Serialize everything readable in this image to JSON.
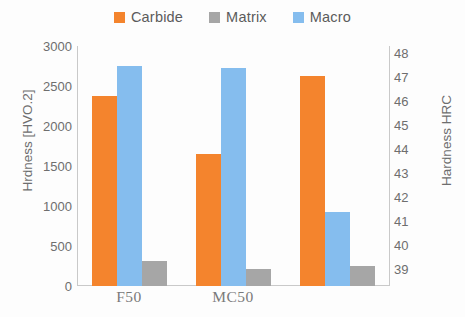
{
  "legend": {
    "items": [
      {
        "label": "Carbide",
        "color": "#F4842D",
        "icon": "square-swatch-icon"
      },
      {
        "label": "Matrix",
        "color": "#A6A6A6",
        "icon": "square-swatch-icon"
      },
      {
        "label": "Macro",
        "color": "#85BDEE",
        "icon": "square-swatch-icon"
      }
    ]
  },
  "axes": {
    "left": {
      "title": "Hrdness [HVO.2]",
      "ticks": [
        "3000",
        "2500",
        "2000",
        "1500",
        "1000",
        "500",
        "0"
      ],
      "min": 0,
      "max": 3000
    },
    "right": {
      "title": "Hardness HRC",
      "ticks": [
        "48",
        "47",
        "46",
        "45",
        "44",
        "43",
        "42",
        "41",
        "40",
        "39"
      ],
      "min": 39,
      "max": 48
    }
  },
  "chart_data": {
    "type": "bar",
    "title": "",
    "xlabel": "",
    "ylabel": "Hrdness [HVO.2]",
    "y2label": "Hardness HRC",
    "ylim": [
      0,
      3000
    ],
    "y2lim": [
      39,
      48
    ],
    "grid": false,
    "legend_position": "top-center",
    "categories": [
      "F50",
      "MC50",
      ""
    ],
    "series": [
      {
        "name": "Carbide",
        "color": "#F4842D",
        "axis": "left",
        "values": [
          2370,
          1650,
          2620
        ]
      },
      {
        "name": "Matrix",
        "color": "#A6A6A6",
        "axis": "left",
        "values": [
          310,
          210,
          250
        ]
      },
      {
        "name": "Macro",
        "color": "#85BDEE",
        "axis": "left",
        "values": [
          2750,
          2720,
          920
        ]
      }
    ],
    "bar_order": [
      "Carbide",
      "Macro",
      "Matrix"
    ]
  }
}
